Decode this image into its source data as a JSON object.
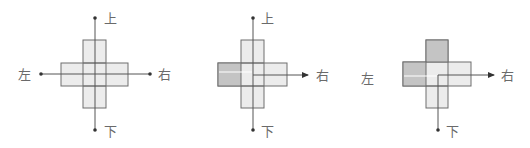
{
  "colors": {
    "light_fill": "#ececec",
    "dark_fill": "#c4c4c4",
    "stroke": "#6e6e6e",
    "axis": "#555555",
    "label": "#6a6a6a"
  },
  "figures": [
    {
      "id": "figure-1",
      "labels": {
        "up": "上",
        "down": "下",
        "left": "左",
        "right": "右"
      },
      "shaded_cells": []
    },
    {
      "id": "figure-2",
      "labels": {
        "up": "上",
        "down": "下",
        "right": "右"
      },
      "shaded_cells": [
        "left"
      ]
    },
    {
      "id": "figure-3",
      "labels": {
        "down": "下",
        "left": "左",
        "right": "右"
      },
      "shaded_cells": [
        "left",
        "top"
      ]
    }
  ]
}
